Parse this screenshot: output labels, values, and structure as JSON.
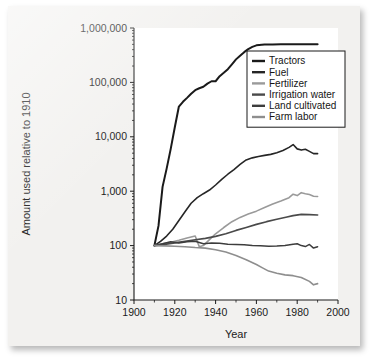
{
  "chart_data": {
    "type": "line",
    "title": "",
    "xlabel": "Year",
    "ylabel": "Amount used relative to 1910",
    "xlim": [
      1900,
      2000
    ],
    "ylim": [
      10,
      1000000
    ],
    "yscale": "log",
    "xscale": "linear",
    "grid": false,
    "legend_position": "upper-right-inside",
    "xticks": [
      1900,
      1920,
      1940,
      1960,
      1980,
      2000
    ],
    "xtick_labels": [
      "1900",
      "1920",
      "1940",
      "1960",
      "1980",
      "2000"
    ],
    "xticks_minor": [
      1910,
      1930,
      1950,
      1970,
      1990
    ],
    "yticks": [
      10,
      100,
      1000,
      10000,
      100000,
      1000000
    ],
    "ytick_labels": [
      "10",
      "100",
      "1,000",
      "10,000",
      "100,000",
      "1,000,000"
    ],
    "series": [
      {
        "name": "Tractors",
        "color": "#1a1a1a",
        "width": 2.0,
        "x": [
          1910,
          1912,
          1914,
          1916,
          1918,
          1920,
          1922,
          1924,
          1926,
          1928,
          1930,
          1932,
          1934,
          1936,
          1938,
          1940,
          1942,
          1944,
          1946,
          1948,
          1950,
          1952,
          1954,
          1956,
          1958,
          1960,
          1964,
          1968,
          1972,
          1976,
          1980,
          1984,
          1988,
          1990
        ],
        "y": [
          100,
          230,
          1200,
          2600,
          6000,
          15000,
          36000,
          44000,
          52000,
          62000,
          72000,
          78000,
          83000,
          95000,
          105000,
          105000,
          130000,
          150000,
          175000,
          215000,
          265000,
          310000,
          360000,
          410000,
          450000,
          480000,
          495000,
          500000,
          505000,
          505000,
          505000,
          505000,
          505000,
          505000
        ]
      },
      {
        "name": "Fuel",
        "color": "#262626",
        "width": 1.6,
        "x": [
          1910,
          1913,
          1916,
          1919,
          1922,
          1925,
          1928,
          1931,
          1934,
          1937,
          1940,
          1943,
          1946,
          1949,
          1952,
          1955,
          1958,
          1961,
          1964,
          1967,
          1970,
          1973,
          1976,
          1978,
          1980,
          1982,
          1984,
          1986,
          1988,
          1990
        ],
        "y": [
          100,
          120,
          150,
          200,
          290,
          420,
          600,
          760,
          900,
          1050,
          1300,
          1650,
          2050,
          2500,
          3100,
          3750,
          4100,
          4350,
          4550,
          4750,
          5100,
          5600,
          6400,
          7200,
          6000,
          5700,
          5900,
          5400,
          4900,
          4900
        ]
      },
      {
        "name": "Fertilizer",
        "color": "#9a9a9a",
        "width": 1.6,
        "x": [
          1910,
          1914,
          1918,
          1922,
          1926,
          1930,
          1932,
          1934,
          1936,
          1938,
          1940,
          1944,
          1948,
          1952,
          1956,
          1960,
          1964,
          1968,
          1972,
          1976,
          1978,
          1980,
          1982,
          1984,
          1986,
          1988,
          1990
        ],
        "y": [
          100,
          108,
          115,
          125,
          138,
          150,
          95,
          100,
          118,
          140,
          165,
          215,
          275,
          330,
          380,
          430,
          500,
          580,
          660,
          760,
          880,
          830,
          940,
          900,
          870,
          810,
          800
        ]
      },
      {
        "name": "Irrigation water",
        "color": "#4a4a4a",
        "width": 1.7,
        "x": [
          1910,
          1915,
          1920,
          1925,
          1930,
          1935,
          1940,
          1945,
          1950,
          1955,
          1960,
          1965,
          1970,
          1975,
          1978,
          1982,
          1986,
          1990
        ],
        "y": [
          100,
          105,
          112,
          120,
          128,
          136,
          148,
          165,
          190,
          215,
          245,
          275,
          305,
          335,
          355,
          375,
          372,
          365
        ]
      },
      {
        "name": "Land cultivated",
        "color": "#3d3d3d",
        "width": 1.5,
        "x": [
          1910,
          1914,
          1918,
          1922,
          1926,
          1930,
          1934,
          1938,
          1942,
          1946,
          1950,
          1954,
          1958,
          1962,
          1966,
          1970,
          1974,
          1978,
          1980,
          1982,
          1984,
          1986,
          1988,
          1990
        ],
        "y": [
          100,
          108,
          118,
          112,
          118,
          120,
          108,
          112,
          110,
          106,
          105,
          104,
          100,
          99,
          97,
          98,
          100,
          106,
          108,
          100,
          96,
          105,
          90,
          95
        ]
      },
      {
        "name": "Farm labor",
        "color": "#8e8e8e",
        "width": 1.6,
        "x": [
          1910,
          1915,
          1920,
          1925,
          1930,
          1935,
          1940,
          1945,
          1950,
          1955,
          1960,
          1963,
          1966,
          1970,
          1974,
          1978,
          1982,
          1986,
          1988,
          1990
        ],
        "y": [
          100,
          99,
          97,
          95,
          92,
          90,
          84,
          76,
          66,
          55,
          45,
          39,
          34,
          31,
          29,
          28,
          26,
          22,
          19,
          20
        ]
      }
    ]
  },
  "axes": {
    "y_title": "Amount used relative to 1910",
    "x_title": "Year"
  },
  "legend": {
    "items": [
      {
        "label": "Tractors"
      },
      {
        "label": "Fuel"
      },
      {
        "label": "Fertilizer"
      },
      {
        "label": "Irrigation water"
      },
      {
        "label": "Land cultivated"
      },
      {
        "label": "Farm labor"
      }
    ]
  }
}
